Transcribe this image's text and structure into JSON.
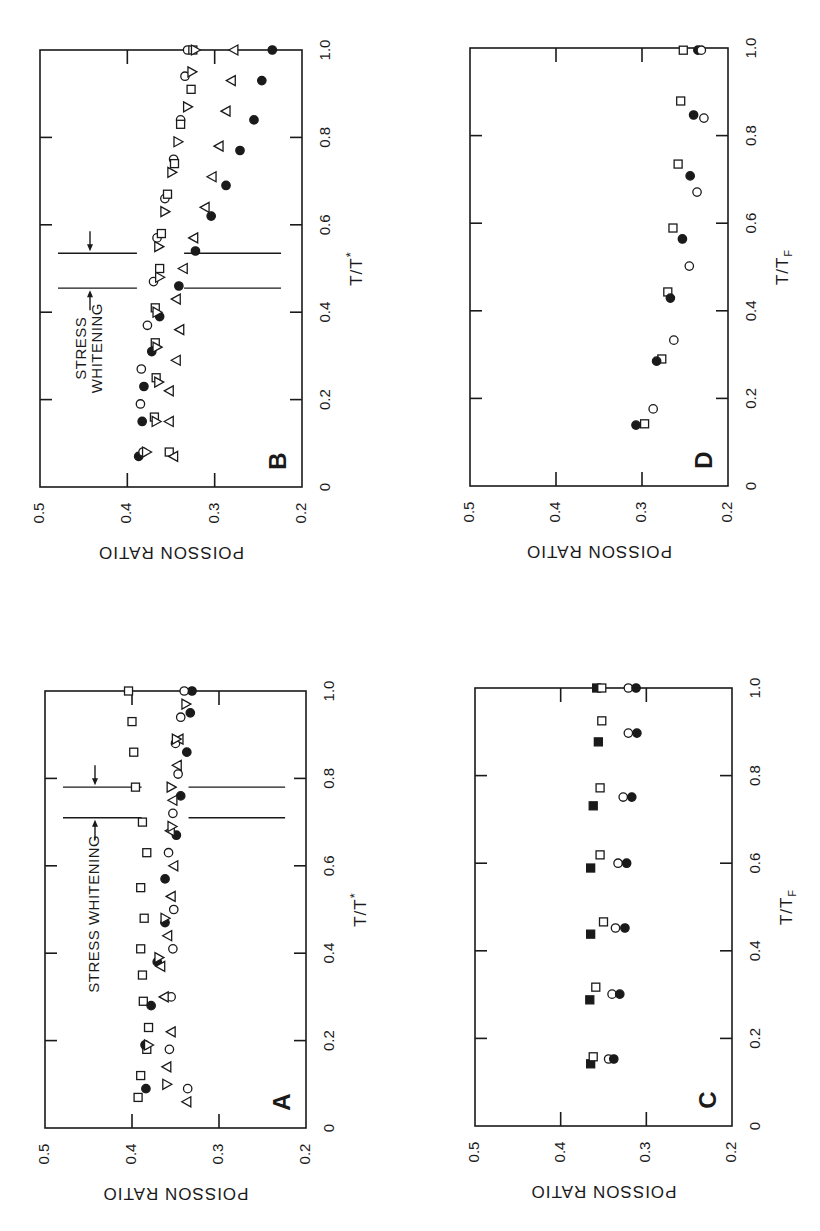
{
  "page": {
    "orientation": "rotated-90-ccw",
    "ink_color": "#1a1a1a",
    "background": "#ffffff"
  },
  "chart_data": [
    {
      "type": "scatter",
      "panel_label": "A",
      "title": "",
      "xlabel": "T/T*",
      "ylabel": "POISSON RATIO",
      "xlim": [
        0,
        1.0
      ],
      "ylim": [
        0.2,
        0.5
      ],
      "x_ticks": [
        "0",
        "0.2",
        "0.4",
        "0.6",
        "0.8",
        "1.0"
      ],
      "y_ticks": [
        "0.5",
        "0.4",
        "0.3",
        "0.2"
      ],
      "annotation": {
        "text": "STRESS WHITENING",
        "x_range": [
          0.71,
          0.78
        ]
      },
      "geom": {
        "x0": 45,
        "x1": 306,
        "yT0": 1128,
        "yT1": 691
      },
      "series": [
        {
          "name": "open squares",
          "marker": "square",
          "filled": false,
          "x": [
            0.07,
            0.12,
            0.18,
            0.23,
            0.29,
            0.35,
            0.41,
            0.48,
            0.55,
            0.63,
            0.7,
            0.78,
            0.86,
            0.93,
            1.0
          ],
          "y": [
            0.393,
            0.39,
            0.383,
            0.381,
            0.387,
            0.388,
            0.39,
            0.386,
            0.39,
            0.383,
            0.388,
            0.396,
            0.398,
            0.4,
            0.404
          ]
        },
        {
          "name": "filled circles",
          "marker": "circle",
          "filled": true,
          "x": [
            0.09,
            0.19,
            0.28,
            0.38,
            0.47,
            0.57,
            0.67,
            0.76,
            0.86,
            0.95,
            1.0
          ],
          "y": [
            0.384,
            0.385,
            0.378,
            0.371,
            0.362,
            0.362,
            0.349,
            0.344,
            0.337,
            0.333,
            0.331
          ]
        },
        {
          "name": "open circles",
          "marker": "circle",
          "filled": false,
          "x": [
            0.09,
            0.18,
            0.3,
            0.41,
            0.5,
            0.63,
            0.72,
            0.81,
            0.88,
            0.94,
            1.0
          ],
          "y": [
            0.336,
            0.357,
            0.355,
            0.353,
            0.352,
            0.358,
            0.353,
            0.347,
            0.35,
            0.344,
            0.34
          ]
        },
        {
          "name": "left triangles",
          "marker": "triangle-left",
          "filled": false,
          "x": [
            0.06,
            0.14,
            0.22,
            0.3,
            0.37,
            0.44,
            0.53,
            0.6,
            0.68,
            0.75,
            0.83,
            0.89
          ],
          "y": [
            0.337,
            0.36,
            0.355,
            0.363,
            0.367,
            0.359,
            0.355,
            0.352,
            0.356,
            0.353,
            0.348,
            0.346
          ]
        },
        {
          "name": "right triangles",
          "marker": "triangle-right",
          "filled": false,
          "x": [
            0.1,
            0.19,
            0.39,
            0.48,
            0.69,
            0.78,
            0.89,
            0.97
          ],
          "y": [
            0.36,
            0.381,
            0.369,
            0.362,
            0.354,
            0.355,
            0.349,
            0.338
          ]
        }
      ]
    },
    {
      "type": "scatter",
      "panel_label": "B",
      "title": "",
      "xlabel": "T/T*",
      "ylabel": "POISSON RATIO",
      "xlim": [
        0,
        1.0
      ],
      "ylim": [
        0.2,
        0.5
      ],
      "x_ticks": [
        "0",
        "0.2",
        "0.4",
        "0.6",
        "0.8",
        "1.0"
      ],
      "y_ticks": [
        "0.5",
        "0.4",
        "0.3",
        "0.2"
      ],
      "annotation": {
        "text": "STRESS WHITENING",
        "x_range": [
          0.455,
          0.535
        ]
      },
      "geom": {
        "x0": 40,
        "x1": 302,
        "yT0": 487,
        "yT1": 50
      },
      "series": [
        {
          "name": "filled circles",
          "marker": "circle",
          "filled": true,
          "x": [
            0.07,
            0.15,
            0.23,
            0.31,
            0.39,
            0.46,
            0.54,
            0.62,
            0.69,
            0.77,
            0.84,
            0.93,
            1.0
          ],
          "y": [
            0.387,
            0.383,
            0.381,
            0.372,
            0.363,
            0.341,
            0.322,
            0.304,
            0.287,
            0.271,
            0.255,
            0.246,
            0.234
          ]
        },
        {
          "name": "open circles",
          "marker": "circle",
          "filled": false,
          "x": [
            0.08,
            0.19,
            0.27,
            0.37,
            0.47,
            0.57,
            0.66,
            0.75,
            0.84,
            0.94,
            1.0
          ],
          "y": [
            0.382,
            0.385,
            0.384,
            0.377,
            0.37,
            0.366,
            0.357,
            0.347,
            0.339,
            0.334,
            0.331
          ]
        },
        {
          "name": "open squares",
          "marker": "square",
          "filled": false,
          "x": [
            0.08,
            0.16,
            0.25,
            0.33,
            0.41,
            0.5,
            0.58,
            0.67,
            0.74,
            0.83,
            0.91,
            1.0
          ],
          "y": [
            0.352,
            0.369,
            0.367,
            0.368,
            0.368,
            0.363,
            0.361,
            0.354,
            0.346,
            0.339,
            0.327,
            0.325
          ]
        },
        {
          "name": "right triangles",
          "marker": "triangle-right",
          "filled": false,
          "x": [
            0.08,
            0.15,
            0.24,
            0.32,
            0.4,
            0.48,
            0.55,
            0.63,
            0.72,
            0.79,
            0.87,
            0.95,
            1.0
          ],
          "y": [
            0.378,
            0.367,
            0.364,
            0.366,
            0.366,
            0.363,
            0.364,
            0.357,
            0.349,
            0.342,
            0.331,
            0.326,
            0.322
          ]
        },
        {
          "name": "left triangles",
          "marker": "triangle-left",
          "filled": false,
          "x": [
            0.07,
            0.15,
            0.22,
            0.29,
            0.36,
            0.43,
            0.5,
            0.57,
            0.64,
            0.71,
            0.78,
            0.86,
            0.93,
            1.0
          ],
          "y": [
            0.347,
            0.352,
            0.352,
            0.344,
            0.34,
            0.344,
            0.336,
            0.324,
            0.311,
            0.303,
            0.295,
            0.287,
            0.281,
            0.278
          ]
        }
      ]
    },
    {
      "type": "scatter",
      "panel_label": "C",
      "title": "",
      "xlabel": "T/T_F",
      "ylabel": "POISSON RATIO",
      "xlim": [
        0,
        1.0
      ],
      "ylim": [
        0.2,
        0.5
      ],
      "x_ticks": [
        "0",
        "0.2",
        "0.4",
        "0.6",
        "0.8",
        "1.0"
      ],
      "y_ticks": [
        "0.5",
        "0.4",
        "0.3",
        "0.2"
      ],
      "geom": {
        "x0": 475,
        "x1": 732,
        "yT0": 1126,
        "yT1": 688
      },
      "series": [
        {
          "name": "filled squares",
          "marker": "square",
          "filled": true,
          "x": [
            0.142,
            0.288,
            0.438,
            0.589,
            0.731,
            0.877,
            1.0
          ],
          "y": [
            0.365,
            0.366,
            0.365,
            0.365,
            0.362,
            0.356,
            0.358
          ]
        },
        {
          "name": "open squares",
          "marker": "square",
          "filled": false,
          "x": [
            0.158,
            0.317,
            0.466,
            0.619,
            0.772,
            0.925,
            1.0
          ],
          "y": [
            0.362,
            0.359,
            0.35,
            0.354,
            0.354,
            0.352,
            0.352
          ]
        },
        {
          "name": "open circles",
          "marker": "circle",
          "filled": false,
          "x": [
            0.153,
            0.301,
            0.452,
            0.6,
            0.751,
            0.897,
            1.0
          ],
          "y": [
            0.344,
            0.34,
            0.336,
            0.333,
            0.327,
            0.321,
            0.321
          ]
        },
        {
          "name": "filled circles",
          "marker": "circle",
          "filled": true,
          "x": [
            0.153,
            0.301,
            0.452,
            0.6,
            0.751,
            0.897,
            1.0
          ],
          "y": [
            0.338,
            0.331,
            0.325,
            0.323,
            0.317,
            0.311,
            0.312
          ]
        }
      ]
    },
    {
      "type": "scatter",
      "panel_label": "D",
      "title": "",
      "xlabel": "T/T_F",
      "ylabel": "POISSON RATIO",
      "xlim": [
        0,
        1.0
      ],
      "ylim": [
        0.2,
        0.5
      ],
      "x_ticks": [
        "0",
        "0.2",
        "0.4",
        "0.6",
        "0.8",
        "1.0"
      ],
      "y_ticks": [
        "0.5",
        "0.4",
        "0.3",
        "0.2"
      ],
      "geom": {
        "x0": 470,
        "x1": 728,
        "yT0": 486,
        "yT1": 48
      },
      "series": [
        {
          "name": "open squares",
          "marker": "square",
          "filled": false,
          "x": [
            0.142,
            0.29,
            0.443,
            0.589,
            0.735,
            0.879,
            0.995
          ],
          "y": [
            0.297,
            0.277,
            0.27,
            0.264,
            0.258,
            0.255,
            0.252
          ]
        },
        {
          "name": "filled circles",
          "marker": "circle",
          "filled": true,
          "x": [
            0.139,
            0.285,
            0.429,
            0.564,
            0.708,
            0.847,
            0.995
          ],
          "y": [
            0.307,
            0.283,
            0.267,
            0.253,
            0.244,
            0.24,
            0.235
          ]
        },
        {
          "name": "open circles",
          "marker": "circle",
          "filled": false,
          "x": [
            0.176,
            0.333,
            0.502,
            0.671,
            0.84,
            0.995
          ],
          "y": [
            0.287,
            0.263,
            0.245,
            0.236,
            0.228,
            0.231
          ]
        }
      ]
    }
  ]
}
